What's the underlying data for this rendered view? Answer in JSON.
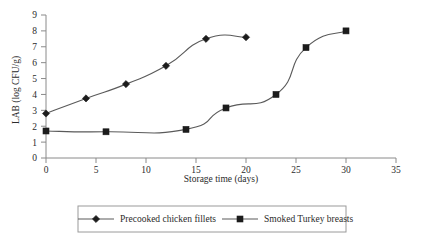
{
  "chart_data": {
    "type": "line",
    "title": "",
    "xlabel": "Storage time (days)",
    "ylabel": "LAB (log CFU/g)",
    "xlim": [
      0,
      35
    ],
    "ylim": [
      0,
      9
    ],
    "xticks": [
      0,
      5,
      10,
      15,
      20,
      25,
      30,
      35
    ],
    "yticks": [
      0,
      1,
      2,
      3,
      4,
      5,
      6,
      7,
      8,
      9
    ],
    "xtick_labels": [
      "0",
      "5",
      "10",
      "15",
      "20",
      "25",
      "30",
      "35"
    ],
    "ytick_labels": [
      "0",
      "1",
      "2",
      "3",
      "4",
      "5",
      "6",
      "7",
      "8",
      "9"
    ],
    "grid": false,
    "legend_position": "bottom",
    "series": [
      {
        "name": "Precooked chicken fillets",
        "marker": "diamond",
        "color": "#1c1c1c",
        "x": [
          0,
          4,
          8,
          12,
          16,
          20
        ],
        "values": [
          2.8,
          3.75,
          4.65,
          5.8,
          7.5,
          7.6
        ]
      },
      {
        "name": "Smoked Turkey breasts",
        "marker": "square",
        "color": "#1c1c1c",
        "x": [
          0,
          6,
          14,
          18,
          23,
          26,
          30
        ],
        "values": [
          1.7,
          1.65,
          1.8,
          3.15,
          4.0,
          6.95,
          8.0
        ]
      }
    ]
  },
  "legend": {
    "entries": [
      {
        "label": "Precooked chicken fillets",
        "marker": "diamond"
      },
      {
        "label": "Smoked Turkey breasts",
        "marker": "square"
      }
    ]
  },
  "axes": {
    "x_title": "Storage time (days)",
    "y_title": "LAB (log CFU/g)"
  }
}
